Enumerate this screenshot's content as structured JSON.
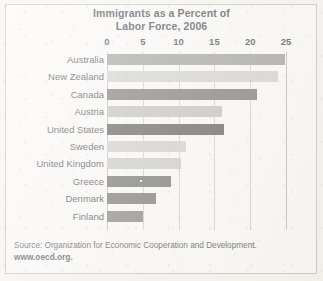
{
  "chart_data": {
    "type": "bar",
    "orientation": "horizontal",
    "title": "Immigrants as a Percent of Labor Force, 2006",
    "title_line1": "Immigrants as a Percent of",
    "title_line2": "Labor Force, 2006",
    "xlabel": "",
    "ylabel": "",
    "xlim": [
      0,
      25
    ],
    "xticks": [
      0,
      5,
      10,
      15,
      20,
      25
    ],
    "xtick_labels": [
      "0",
      "5",
      "10",
      "15",
      "20",
      "25"
    ],
    "grid": "vertical",
    "legend": "none",
    "categories": [
      "Australia",
      "New Zealand",
      "Canada",
      "Austria",
      "United States",
      "Sweden",
      "United Kingdom",
      "Greece",
      "Denmark",
      "Finland"
    ],
    "values": [
      24.8,
      23.9,
      21.0,
      16.0,
      16.3,
      11.0,
      10.4,
      9.0,
      6.8,
      5.0
    ],
    "bar_colors": [
      "#8d8d8d",
      "#c8c8c8",
      "#5e5e5e",
      "#b4b4b4",
      "#3f3f3f",
      "#c4c4c4",
      "#bfbfbf",
      "#555555",
      "#5a5a5a",
      "#6a6a6a"
    ],
    "annotations": [
      {
        "name": "greece-bar-marker",
        "category": "Greece",
        "value": 4.8,
        "shape": "small white square"
      }
    ]
  },
  "source": {
    "line1": "Source: Organization for Economic Cooperation and Development.",
    "line2": "www.oecd.org."
  },
  "colors": {
    "page_background": "#f2f1ec",
    "frame_border": "#b9b6ae",
    "gridline": "#c8c5bd",
    "text": "#22262e"
  }
}
